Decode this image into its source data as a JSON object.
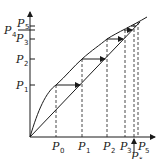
{
  "diagram": {
    "type": "cobweb",
    "y_axis_labels": [
      {
        "base": "P",
        "sub": "1"
      },
      {
        "base": "P",
        "sub": "2"
      },
      {
        "base": "P",
        "sub": "3"
      },
      {
        "base": "P",
        "sub": "4"
      },
      {
        "base": "P",
        "sub": "5"
      }
    ],
    "x_axis_labels": [
      {
        "base": "P",
        "sub": "0"
      },
      {
        "base": "P",
        "sub": "1"
      },
      {
        "base": "P",
        "sub": "2"
      },
      {
        "base": "P",
        "sub": "3"
      },
      {
        "base": "P",
        "sub": "*"
      },
      {
        "base": "P",
        "sub": "5"
      }
    ],
    "elements": [
      "curve f(P)",
      "diagonal y = x",
      "horizontal arrows",
      "vertical dashed projections"
    ],
    "line_color": "#1a1a1a",
    "background": "#ffffff"
  }
}
